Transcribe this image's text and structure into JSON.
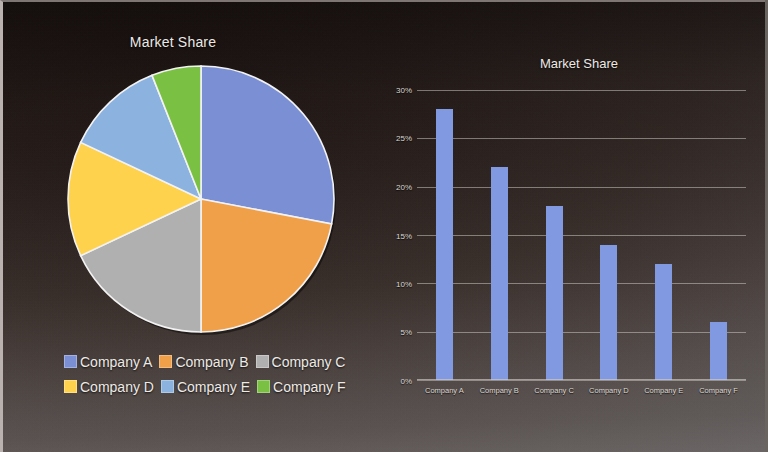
{
  "chart_data": [
    {
      "type": "pie",
      "title": "Market Share",
      "categories": [
        "Company A",
        "Company B",
        "Company C",
        "Company D",
        "Company E",
        "Company F"
      ],
      "values": [
        28,
        22,
        18,
        14,
        12,
        6
      ],
      "unit": "%",
      "colors": [
        "#7b8fd4",
        "#f0a049",
        "#b0b0b0",
        "#ffd24d",
        "#8cb3e0",
        "#7ac043"
      ],
      "legend_position": "bottom-left",
      "start_angle": 0,
      "direction": "clockwise",
      "slice_border": "#ffffff"
    },
    {
      "type": "bar",
      "title": "Market Share",
      "categories": [
        "Company A",
        "Company B",
        "Company C",
        "Company D",
        "Company E",
        "Company F"
      ],
      "values": [
        28,
        22,
        18,
        14,
        12,
        6
      ],
      "xlabel": "",
      "ylabel": "",
      "ylim": [
        0,
        30
      ],
      "ytick_labels": [
        "0%",
        "5%",
        "10%",
        "15%",
        "20%",
        "25%",
        "30%"
      ],
      "ytick_values": [
        0,
        5,
        10,
        15,
        20,
        25,
        30
      ],
      "grid": true,
      "legend_position": "none",
      "bar_color": "#8099e0"
    }
  ],
  "pie": {
    "title": "Market Share",
    "slices": [
      {
        "label": "Company A",
        "value": 28,
        "color": "#7b8fd4"
      },
      {
        "label": "Company B",
        "value": 22,
        "color": "#f0a049"
      },
      {
        "label": "Company C",
        "value": 18,
        "color": "#b0b0b0"
      },
      {
        "label": "Company D",
        "value": 14,
        "color": "#ffd24d"
      },
      {
        "label": "Company E",
        "value": 12,
        "color": "#8cb3e0"
      },
      {
        "label": "Company F",
        "value": 6,
        "color": "#7ac043"
      }
    ]
  },
  "bar": {
    "title": "Market Share",
    "yticks": [
      "30%",
      "25%",
      "20%",
      "15%",
      "10%",
      "5%",
      "0%"
    ],
    "ymax": 30,
    "bar_color": "#8099e0",
    "items": [
      {
        "label": "Company A",
        "value": 28
      },
      {
        "label": "Company B",
        "value": 22
      },
      {
        "label": "Company C",
        "value": 18
      },
      {
        "label": "Company D",
        "value": 14
      },
      {
        "label": "Company E",
        "value": 12
      },
      {
        "label": "Company F",
        "value": 6
      }
    ]
  },
  "theme": {
    "background_dark": "#241a17",
    "background_light": "#565150",
    "text_color": "#ece8e4",
    "grid_color": "#d0cbc6"
  }
}
